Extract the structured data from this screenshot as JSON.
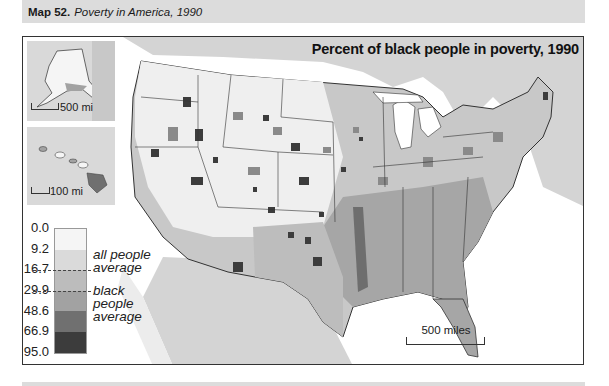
{
  "header": {
    "map_number": "Map 52.",
    "map_title": "Poverty in America, 1990"
  },
  "map": {
    "title": "Percent of black people in poverty, 1990",
    "scale_main": "500 miles",
    "insets": [
      {
        "name": "Alaska",
        "scale_label": "500 mi"
      },
      {
        "name": "Hawaii",
        "scale_label": "100 mi"
      }
    ]
  },
  "legend": {
    "breaks": [
      "0.0",
      "9.2",
      "16.7",
      "29.9",
      "48.6",
      "66.9",
      "95.0"
    ],
    "colors": [
      "#f5f5f5",
      "#dadada",
      "#bcbcbc",
      "#a2a2a2",
      "#707070",
      "#3c3c3c"
    ],
    "markers": [
      {
        "value": "16.7",
        "label_line1": "all people",
        "label_line2": "average"
      },
      {
        "value": "29.9",
        "label_line1": "black people",
        "label_line2": "average"
      }
    ]
  },
  "colors": {
    "land_outside": "#d4d4d4",
    "water": "#ffffff",
    "border": "#333333",
    "header_bg": "#dcdcdc"
  }
}
